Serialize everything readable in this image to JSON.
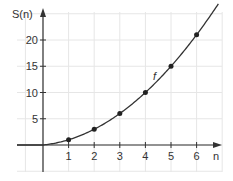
{
  "chart_data": {
    "type": "line",
    "title": "",
    "xlabel": "n",
    "ylabel": "S(n)",
    "curve_label": "f",
    "x_ticks": [
      "1",
      "2",
      "3",
      "4",
      "5",
      "6"
    ],
    "y_ticks": [
      "5",
      "10",
      "15",
      "20"
    ],
    "xlim": [
      -1.7,
      7
    ],
    "ylim": [
      -5,
      24
    ],
    "grid": true,
    "series": [
      {
        "name": "f",
        "x": [
          1,
          2,
          3,
          4,
          5,
          6
        ],
        "values": [
          1,
          3,
          6,
          10,
          15,
          21
        ],
        "markers": true
      }
    ],
    "curve_formula": "S(n) = n(n+1)/2",
    "colors": {
      "grid": "#e6e6e6",
      "axis": "#333333",
      "curve": "#333333"
    }
  }
}
